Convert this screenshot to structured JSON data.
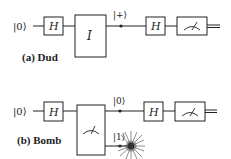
{
  "figure": {
    "panels": [
      {
        "id": "a",
        "caption": "(a) Dud",
        "input_state": "|0⟩",
        "gate1": "H",
        "middle_gate": "I",
        "intermediate_state": "|+⟩",
        "gate2": "H",
        "measurement": "meter"
      },
      {
        "id": "b",
        "caption": "(b) Bomb",
        "input_state": "|0⟩",
        "gate1": "H",
        "middle_gate": "measurement",
        "output_state_top": "|0⟩",
        "output_state_bottom": "|1⟩",
        "gate2": "H",
        "measurement": "meter",
        "explosion": "bomb-explosion"
      }
    ],
    "colors": {
      "line": "#222222",
      "background": "#ffffff"
    }
  }
}
